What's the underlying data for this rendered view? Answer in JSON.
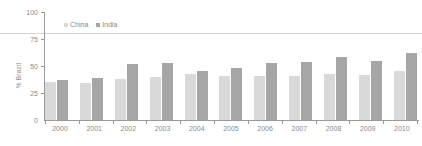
{
  "chart_data": {
    "type": "bar",
    "title": "",
    "xlabel": "",
    "ylabel": "% Brazil",
    "ylim": [
      0,
      100
    ],
    "yticks": [
      0,
      25,
      50,
      75,
      100
    ],
    "grid": false,
    "legend_position": "top-left",
    "categories": [
      "2000",
      "2001",
      "2002",
      "2003",
      "2004",
      "2005",
      "2006",
      "2007",
      "2008",
      "2009",
      "2010"
    ],
    "series": [
      {
        "name": "China",
        "color": "#d9d9d9",
        "values": [
          35,
          34,
          38,
          40,
          43,
          41,
          41,
          41,
          43,
          42,
          45
        ]
      },
      {
        "name": "India",
        "color": "#a6a6a6",
        "values": [
          37,
          39,
          52,
          53,
          45,
          48,
          53,
          54,
          58,
          55,
          62
        ]
      }
    ]
  },
  "axis": {
    "y_label": "% Brazil",
    "y_ticks": [
      "100",
      "75",
      "50",
      "25",
      "0"
    ]
  },
  "legend": {
    "items": [
      {
        "label": "China",
        "marker": "square-swatch"
      },
      {
        "label": "India",
        "marker": "square-swatch"
      }
    ]
  }
}
